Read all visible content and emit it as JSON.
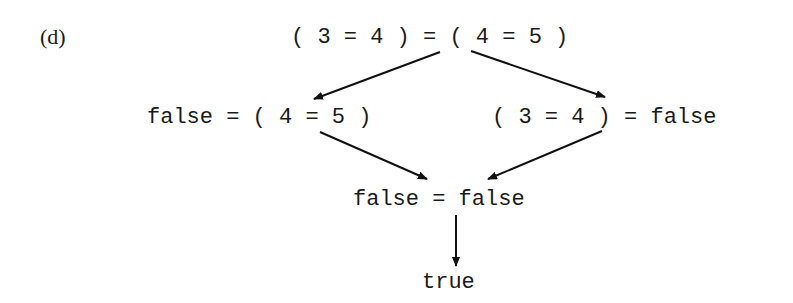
{
  "figure": {
    "label": "(d)",
    "nodes": {
      "root": "( 3 = 4 ) = ( 4 = 5 )",
      "left": "false = ( 4 = 5 )",
      "right": "( 3 = 4 ) = false",
      "merge": "false = false",
      "result": "true"
    },
    "edges": [
      {
        "from": "root",
        "to": "left"
      },
      {
        "from": "root",
        "to": "right"
      },
      {
        "from": "left",
        "to": "merge"
      },
      {
        "from": "right",
        "to": "merge"
      },
      {
        "from": "merge",
        "to": "result"
      }
    ]
  }
}
